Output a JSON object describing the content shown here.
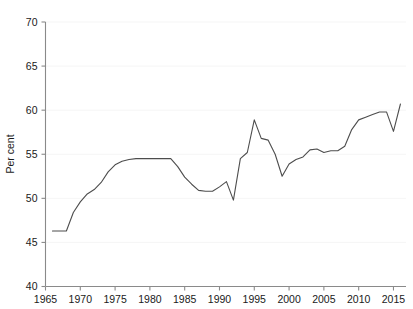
{
  "chart_data": {
    "type": "line",
    "title": "",
    "subtitle": "",
    "xlabel": "",
    "ylabel": "Per cent",
    "xlim": [
      1965,
      2016.8
    ],
    "ylim": [
      40,
      70
    ],
    "xticks": [
      1965,
      1970,
      1975,
      1980,
      1985,
      1990,
      1995,
      2000,
      2005,
      2010,
      2015
    ],
    "yticks": [
      40,
      45,
      50,
      55,
      60,
      65,
      70
    ],
    "xtick_labels": [
      "1965",
      "1970",
      "1975",
      "1980",
      "1985",
      "1990",
      "1995",
      "2000",
      "2005",
      "2010",
      "2015"
    ],
    "ytick_labels": [
      "40",
      "45",
      "50",
      "55",
      "60",
      "65",
      "70"
    ],
    "grid": "horizontal",
    "legend": "none",
    "line_color": "#4d4d4d",
    "axis_color": "#8a8a8a",
    "grid_color": "#f2f2f2",
    "background_color": "#ffffff",
    "series": [
      {
        "name": "Per cent",
        "x": [
          1966,
          1967,
          1968,
          1969,
          1970,
          1971,
          1972,
          1973,
          1974,
          1975,
          1976,
          1977,
          1978,
          1979,
          1980,
          1981,
          1982,
          1983,
          1984,
          1985,
          1986,
          1987,
          1988,
          1989,
          1990,
          1991,
          1992,
          1993,
          1994,
          1995,
          1996,
          1997,
          1998,
          1999,
          2000,
          2001,
          2002,
          2003,
          2004,
          2005,
          2006,
          2007,
          2008,
          2009,
          2010,
          2011,
          2012,
          2013,
          2014,
          2015,
          2016
        ],
        "values": [
          46.3,
          46.3,
          46.3,
          48.4,
          49.6,
          50.5,
          51.0,
          51.8,
          53.0,
          53.8,
          54.2,
          54.4,
          54.5,
          54.5,
          54.5,
          54.5,
          54.5,
          54.5,
          53.6,
          52.4,
          51.6,
          50.9,
          50.8,
          50.8,
          51.3,
          51.9,
          49.8,
          54.5,
          55.2,
          58.9,
          56.8,
          56.6,
          55.0,
          52.5,
          53.9,
          54.4,
          54.7,
          55.5,
          55.6,
          55.2,
          55.4,
          55.4,
          55.9,
          57.8,
          58.9,
          59.2,
          59.5,
          59.8,
          59.8,
          57.6,
          60.7
        ]
      }
    ]
  },
  "axes": {
    "ylabel": "Per cent"
  }
}
